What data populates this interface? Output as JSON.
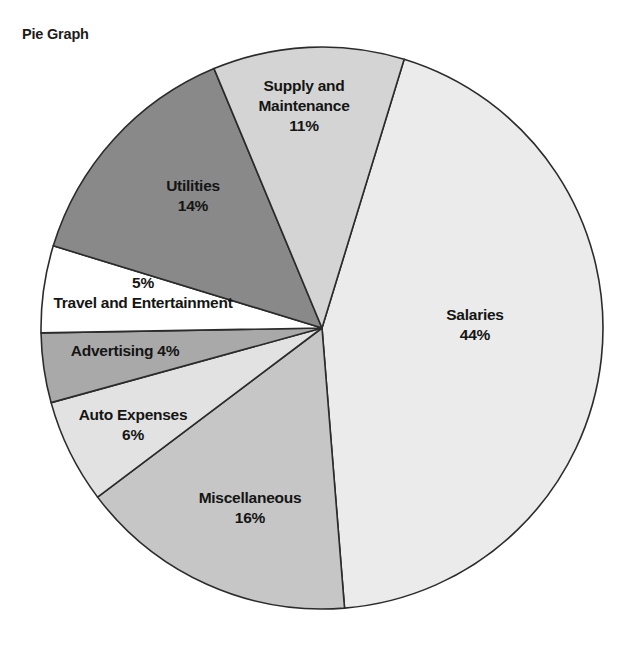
{
  "title": "Pie Graph",
  "chart_data": {
    "type": "pie",
    "title": "Pie Graph",
    "xlabel": "",
    "ylabel": "",
    "legend": "none",
    "grid": false,
    "units": "percent",
    "total": 100,
    "slices": [
      {
        "label": "Salaries",
        "percent_text": "44%",
        "value": 44,
        "color": "#ebebeb",
        "start_angle": 17,
        "end_angle": 175.4,
        "label_x": 475,
        "label_y": 325,
        "layout": "stacked"
      },
      {
        "label": "Miscellaneous",
        "percent_text": "16%",
        "value": 16,
        "color": "#c6c6c6",
        "start_angle": 175.4,
        "end_angle": 233,
        "label_x": 250,
        "label_y": 508,
        "layout": "stacked"
      },
      {
        "label": "Auto Expenses",
        "percent_text": "6%",
        "value": 6,
        "color": "#e2e2e2",
        "start_angle": 233,
        "end_angle": 254.6,
        "label_x": 133,
        "label_y": 425,
        "layout": "stacked"
      },
      {
        "label": "Advertising",
        "percent_text": "4%",
        "value": 4,
        "color": "#a9a9a9",
        "start_angle": 254.6,
        "end_angle": 269,
        "label_x": 125,
        "label_y": 351,
        "layout": "inline"
      },
      {
        "label": "Travel and Entertainment",
        "percent_text": "5%",
        "value": 5,
        "color": "#ffffff",
        "start_angle": 269,
        "end_angle": 287,
        "label_x": 143,
        "label_y": 293,
        "layout": "percent-above"
      },
      {
        "label": "Utilities",
        "percent_text": "14%",
        "value": 14,
        "color": "#898989",
        "start_angle": 287,
        "end_angle": 337.4,
        "label_x": 193,
        "label_y": 196,
        "layout": "stacked"
      },
      {
        "label": "Supply and Maintenance",
        "percent_text": "11%",
        "value": 11,
        "color": "#d4d4d4",
        "start_angle": 337.4,
        "end_angle": 377,
        "label_x": 304,
        "label_y": 106,
        "layout": "stacked-two-line",
        "label_line1": "Supply and",
        "label_line2": "Maintenance"
      }
    ],
    "geometry": {
      "center_x": 322,
      "center_y": 328,
      "radius": 281,
      "stroke_color": "#2b2b2b",
      "stroke_width": 1.6
    }
  }
}
